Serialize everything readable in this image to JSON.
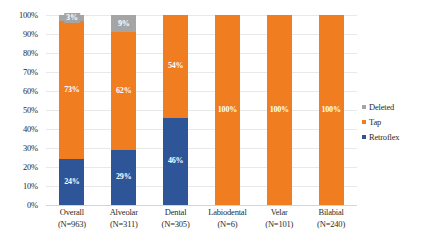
{
  "chart_data": {
    "type": "bar",
    "subtype": "stacked-100-percent",
    "title": "",
    "subtitle": "",
    "xlabel": "",
    "ylabel": "",
    "ylim": [
      0,
      100
    ],
    "ytick_labels": [
      "100%",
      "90%",
      "80%",
      "70%",
      "60%",
      "50%",
      "40%",
      "30%",
      "20%",
      "10%",
      "0%"
    ],
    "ytick_values": [
      100,
      90,
      80,
      70,
      60,
      50,
      40,
      30,
      20,
      10,
      0
    ],
    "grid": true,
    "grid_orientation": "horizontal",
    "legend_position": "right",
    "categories": [
      "Overall",
      "Alveolar",
      "Dental",
      "Labiodental",
      "Velar",
      "Bilabial"
    ],
    "category_sublabels": [
      "(N=963)",
      "(N=311)",
      "(N=305)",
      "(N=6)",
      "(N=101)",
      "(N=240)"
    ],
    "category_counts": [
      963,
      311,
      305,
      6,
      101,
      240
    ],
    "series": [
      {
        "name": "Retroflex",
        "color": "#2e5597",
        "values": [
          24,
          29,
          46,
          0,
          0,
          0
        ],
        "labels": [
          "24%",
          "29%",
          "46%",
          "",
          "",
          ""
        ]
      },
      {
        "name": "Tap",
        "color": "#f07d20",
        "values": [
          73,
          62,
          54,
          100,
          100,
          100
        ],
        "labels": [
          "73%",
          "62%",
          "54%",
          "100%",
          "100%",
          "100%"
        ]
      },
      {
        "name": "Deleted",
        "color": "#a5a5a5",
        "values": [
          3,
          9,
          0,
          0,
          0,
          0
        ],
        "labels": [
          "3%",
          "9%",
          "",
          "",
          "",
          ""
        ]
      }
    ],
    "legend_entries": [
      {
        "label": "Deleted",
        "color": "#a5a5a5"
      },
      {
        "label": "Tap",
        "color": "#f07d20"
      },
      {
        "label": "Retroflex",
        "color": "#2e5597"
      }
    ]
  },
  "colors": {
    "retroflex": "#2e5597",
    "tap": "#f07d20",
    "deleted": "#a5a5a5",
    "gridline": "#e8e8e8",
    "text": "#2b2b2b",
    "background": "#ffffff"
  }
}
